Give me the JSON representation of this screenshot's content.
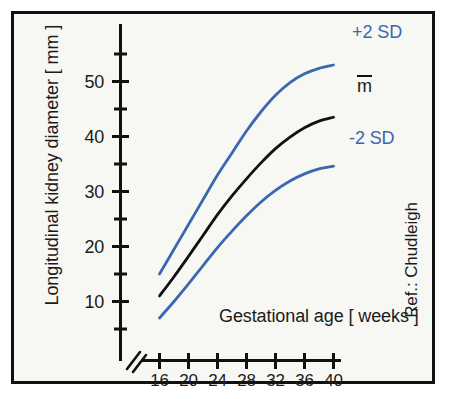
{
  "figure": {
    "background_color": "#f7f7f4",
    "border_color": "#111111",
    "accent_blue": "#3a68ae",
    "mean_black": "#111111"
  },
  "axes": {
    "y_title": "Longitudinal kidney diameter [ mm ]",
    "x_title": "Gestational age [ weeks ]",
    "y_tick_labels": [
      "10",
      "20",
      "30",
      "40",
      "50"
    ],
    "x_tick_labels": [
      "16",
      "20",
      "24",
      "28",
      "32",
      "36",
      "40"
    ],
    "axis_break": "//"
  },
  "annotations": {
    "reference": "Ref.: Chudleigh",
    "series_plus2sd": "+2 SD",
    "series_mean": "m",
    "series_minus2sd": "-2 SD"
  },
  "chart_data": {
    "type": "line",
    "title": "",
    "subtitle": "",
    "xlabel": "Gestational age [ weeks ]",
    "ylabel": "Longitudinal kidney diameter [ mm ]",
    "xlim": [
      15,
      40
    ],
    "ylim": [
      0,
      57
    ],
    "y_ticks_major": [
      10,
      20,
      30,
      40,
      50
    ],
    "y_ticks_minor": [
      5,
      15,
      25,
      35,
      45,
      55
    ],
    "x_ticks": [
      16,
      20,
      24,
      28,
      32,
      36,
      40
    ],
    "grid": false,
    "legend_position": "right-inline-labels",
    "x_axis_break": true,
    "x": [
      16,
      18,
      20,
      22,
      24,
      26,
      28,
      30,
      32,
      34,
      36,
      38,
      40
    ],
    "series": [
      {
        "name": "+2 SD",
        "color": "#3a68ae",
        "values": [
          15.0,
          19.5,
          24.0,
          28.5,
          33.0,
          37.0,
          41.0,
          44.5,
          47.5,
          49.8,
          51.4,
          52.4,
          53.0
        ]
      },
      {
        "name": "m",
        "color": "#111111",
        "values": [
          11.0,
          14.5,
          18.2,
          22.0,
          25.8,
          29.2,
          32.3,
          35.2,
          37.8,
          39.9,
          41.6,
          42.8,
          43.5
        ]
      },
      {
        "name": "-2 SD",
        "color": "#3a68ae",
        "values": [
          7.0,
          10.0,
          13.2,
          16.5,
          19.8,
          22.8,
          25.6,
          28.1,
          30.2,
          31.9,
          33.2,
          34.1,
          34.6
        ]
      }
    ]
  }
}
